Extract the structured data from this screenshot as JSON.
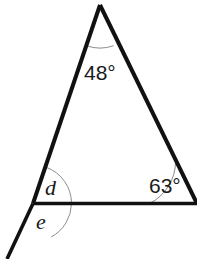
{
  "figure": {
    "background_color": "#ffffff",
    "width": 197,
    "height": 259,
    "stroke_color": "#111111",
    "arc_color": "#8c8c8c",
    "label_color": "#1a1a1a",
    "side_stroke_width": 4,
    "base_stroke_width": 3.6,
    "extension_stroke_width": 3.6,
    "arc_stroke_width": 1
  },
  "geometry": {
    "apex": {
      "x": 100,
      "y": 5
    },
    "bottom_left": {
      "x": 33,
      "y": 203.5
    },
    "bottom_right": {
      "x": 197,
      "y": 203.5
    },
    "extension_end": {
      "x": 7,
      "y": 259
    },
    "paths": {
      "left_side": "M 100 5 L 33 203.5",
      "right_side": "M 100 5 L 197 203.5",
      "base": "M 33 203.5 L 197 203.5",
      "extension": "M 33 203.5 L 7 259"
    },
    "arcs": {
      "apex_arc": "M 86.3 45.7 A 41 41 0 0 0 113.6 45.7",
      "right_vertex_arc": "M 149.5 203.5 A 47.5 47.5 0 0 0 175.6 161.2",
      "d_arc": "M 71.5 203.5 A 38.5 38.5 0 0 0 46 167.2",
      "e_arc": "M 71.5 203.5 A 38.5 38.5 0 0 1 51.1 237.0"
    }
  },
  "labels": {
    "apex_angle": "48°",
    "right_angle": "63°",
    "d_angle": "d",
    "e_angle": "e"
  },
  "chart_data": {
    "type": "diagram",
    "shape": "triangle",
    "angles": [
      {
        "name": "apex_angle",
        "vertex": "top",
        "value": 48,
        "unit": "degrees",
        "label": "48°",
        "known": true
      },
      {
        "name": "right_angle",
        "vertex": "bottom-right",
        "value": 63,
        "unit": "degrees",
        "label": "63°",
        "known": true
      },
      {
        "name": "d_angle",
        "vertex": "bottom-left-interior",
        "value": null,
        "unit": "degrees",
        "label": "d",
        "known": false
      },
      {
        "name": "e_angle",
        "vertex": "bottom-left-exterior",
        "value": null,
        "unit": "degrees",
        "label": "e",
        "known": false
      }
    ],
    "lines": [
      {
        "name": "left-side",
        "from": "bottom-left",
        "to": "apex"
      },
      {
        "name": "right-side",
        "from": "apex",
        "to": "bottom-right"
      },
      {
        "name": "base",
        "from": "bottom-left",
        "to": "bottom-right"
      },
      {
        "name": "base-extension",
        "from": "bottom-left",
        "to": "below-left",
        "note": "ray extending beyond the triangle"
      }
    ]
  }
}
